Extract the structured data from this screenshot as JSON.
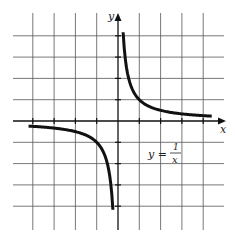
{
  "chart_data": {
    "type": "line",
    "title": "",
    "xlabel": "x",
    "ylabel": "y",
    "xlim": [
      -4,
      4
    ],
    "ylim": [
      -4,
      4
    ],
    "grid": true,
    "series": [
      {
        "name": "y = 1/x",
        "equation": "y = 1/x",
        "x": [
          -4,
          -3,
          -2,
          -1,
          -0.5,
          -0.3,
          -0.25,
          0.25,
          0.3,
          0.5,
          1,
          2,
          3,
          4
        ],
        "values": [
          -0.25,
          -0.33,
          -0.5,
          -1,
          -2,
          -3.33,
          -4,
          4,
          3.33,
          2,
          1,
          0.5,
          0.33,
          0.25
        ]
      }
    ],
    "annotations": [
      {
        "text": "y = 1/x",
        "position": "fourth quadrant, near (1.6, -1.5)"
      }
    ]
  },
  "labels": {
    "x_axis": "x",
    "y_axis": "y",
    "equation_lhs": "y =",
    "equation_num": "1",
    "equation_den": "x"
  }
}
